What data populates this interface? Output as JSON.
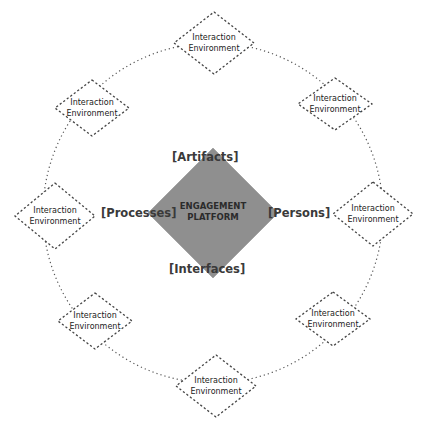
{
  "diagram": {
    "center": {
      "title_line1": "ENGAGEMENT",
      "title_line2": "PLATFORM",
      "fill_color": "#8f8f8f"
    },
    "sides": {
      "top": "[Artifacts]",
      "left": "[Processes]",
      "right": "[Persons]",
      "bottom": "[Interfaces]"
    },
    "ring": {
      "style": "dotted",
      "color": "#555555"
    },
    "environments": [
      {
        "line1": "Interaction",
        "line2": "Environment",
        "position": "top"
      },
      {
        "line1": "Interaction",
        "line2": "Environment",
        "position": "top-right"
      },
      {
        "line1": "Interaction",
        "line2": "Environment",
        "position": "right"
      },
      {
        "line1": "Interaction",
        "line2": "Environment",
        "position": "bottom-right"
      },
      {
        "line1": "Interaction",
        "line2": "Environment",
        "position": "bottom"
      },
      {
        "line1": "Interaction",
        "line2": "Environment",
        "position": "bottom-left"
      },
      {
        "line1": "Interaction",
        "line2": "Environment",
        "position": "left"
      },
      {
        "line1": "Interaction",
        "line2": "Environment",
        "position": "top-left"
      }
    ]
  }
}
